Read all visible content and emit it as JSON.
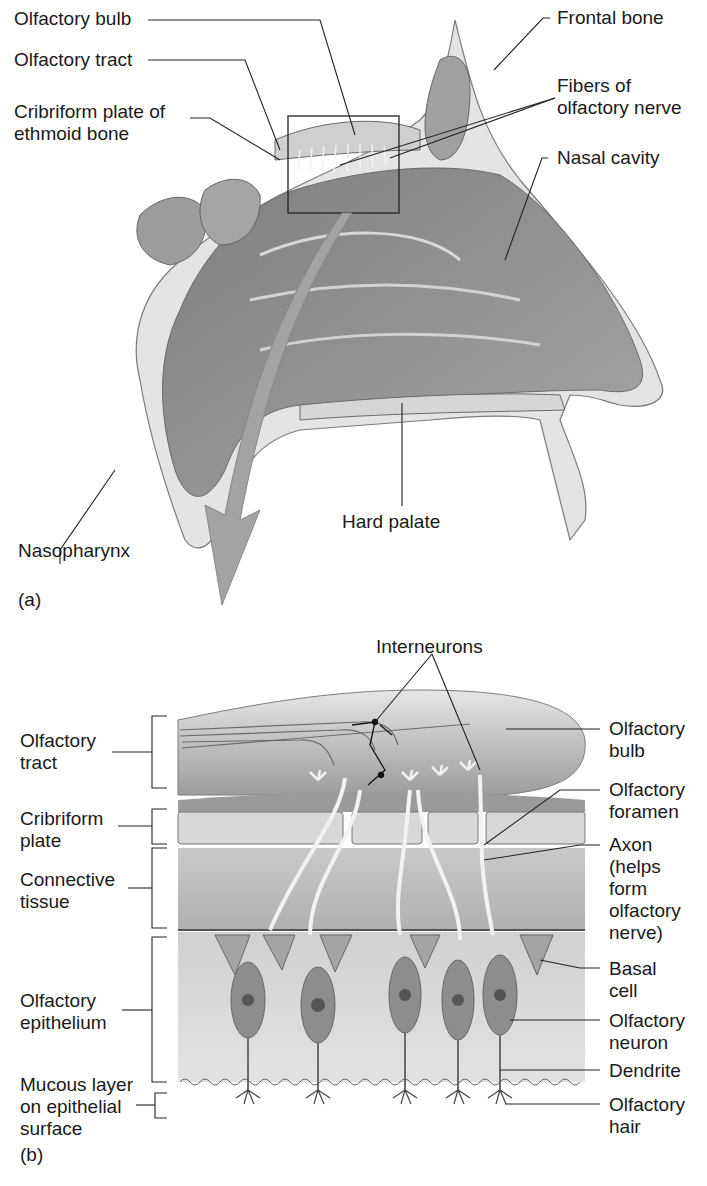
{
  "figure": {
    "panel_a": {
      "tag": "(a)",
      "labels": {
        "olfactory_bulb": "Olfactory bulb",
        "olfactory_tract": "Olfactory tract",
        "cribriform_plate": "Cribriform plate of\nethmoid bone",
        "frontal_bone": "Frontal bone",
        "fibers_of_olfactory_nerve": "Fibers of\nolfactory nerve",
        "nasal_cavity": "Nasal cavity",
        "hard_palate": "Hard palate",
        "nasopharynx": "Nasopharynx"
      }
    },
    "panel_b": {
      "tag": "(b)",
      "title_label": "Interneurons",
      "left_labels": {
        "olfactory_tract": "Olfactory\ntract",
        "cribriform_plate": "Cribriform\nplate",
        "connective_tissue": "Connective\ntissue",
        "olfactory_epithelium": "Olfactory\nepithelium",
        "mucous_layer": "Mucous layer\non epithelial\nsurface"
      },
      "right_labels": {
        "olfactory_bulb": "Olfactory\nbulb",
        "olfactory_foramen": "Olfactory\nforamen",
        "axon": "Axon\n(helps\nform\nolfactory\nnerve)",
        "basal_cell": "Basal\ncell",
        "olfactory_neuron": "Olfactory\nneuron",
        "dendrite": "Dendrite",
        "olfactory_hair": "Olfactory\nhair"
      }
    },
    "colors": {
      "ink": "#1a1a1a",
      "tissue_dark": "#8a8a8a",
      "tissue_mid": "#b4b4b4",
      "tissue_light": "#dcdcdc",
      "arrow": "#9a9a9a"
    }
  }
}
